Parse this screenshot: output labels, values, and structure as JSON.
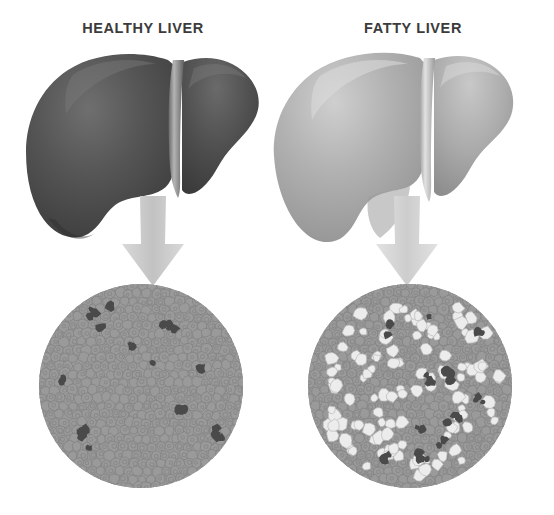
{
  "figure": {
    "kind": "medical-comparison-illustration",
    "background_color": "#ffffff",
    "panel_count": 2
  },
  "panels": [
    {
      "id": "healthy",
      "title": "HEALTHY LIVER",
      "organ": {
        "name": "healthy-liver-organ",
        "fill_color": "#4f4f4f",
        "highlight_color": "#6e6e6e",
        "shadow_color": "#3a3a3a",
        "ligament_color": "#9a9a9a",
        "description": "dark uniform liver with right and left lobes and falciform ligament"
      },
      "arrow": {
        "name": "down-arrow-healthy",
        "direction": "down",
        "color": "#c9c9c9"
      },
      "micrograph": {
        "name": "healthy-liver-tissue-circle",
        "background_color": "#9a9a9a",
        "cell_color": "#9a9a9a",
        "cell_outline_color": "#848484",
        "nucleus_color": "#8b8b8b",
        "dark_spot_color": "#4a4a4a",
        "fat_droplet_color": "#e8e8e8",
        "hepatocyte_count": 370,
        "dark_spot_count": 14,
        "fat_droplet_count": 0,
        "description": "uniform hepatocytes, no fat vacuoles, few dark nuclei clusters"
      }
    },
    {
      "id": "fatty",
      "title": "FATTY LIVER",
      "organ": {
        "name": "fatty-liver-organ",
        "fill_color": "#a8a8a8",
        "highlight_color": "#c6c6c6",
        "shadow_color": "#8f8f8f",
        "ligament_color": "#cfcfcf",
        "description": "enlarged pale liver with right and left lobes and falciform ligament"
      },
      "arrow": {
        "name": "down-arrow-fatty",
        "direction": "down",
        "color": "#d4d4d4"
      },
      "micrograph": {
        "name": "fatty-liver-tissue-circle",
        "background_color": "#9a9a9a",
        "cell_color": "#9a9a9a",
        "cell_outline_color": "#848484",
        "nucleus_color": "#8b8b8b",
        "dark_spot_color": "#4a4a4a",
        "fat_droplet_color": "#ececec",
        "hepatocyte_count": 300,
        "dark_spot_count": 13,
        "fat_droplet_count": 120,
        "description": "hepatocytes crowded with large pale lipid droplets (steatosis)"
      }
    }
  ],
  "geometry": {
    "circle_diameter": 206,
    "circle_top": 283,
    "circle_left_healthy": 38,
    "circle_left_fatty": 307
  }
}
